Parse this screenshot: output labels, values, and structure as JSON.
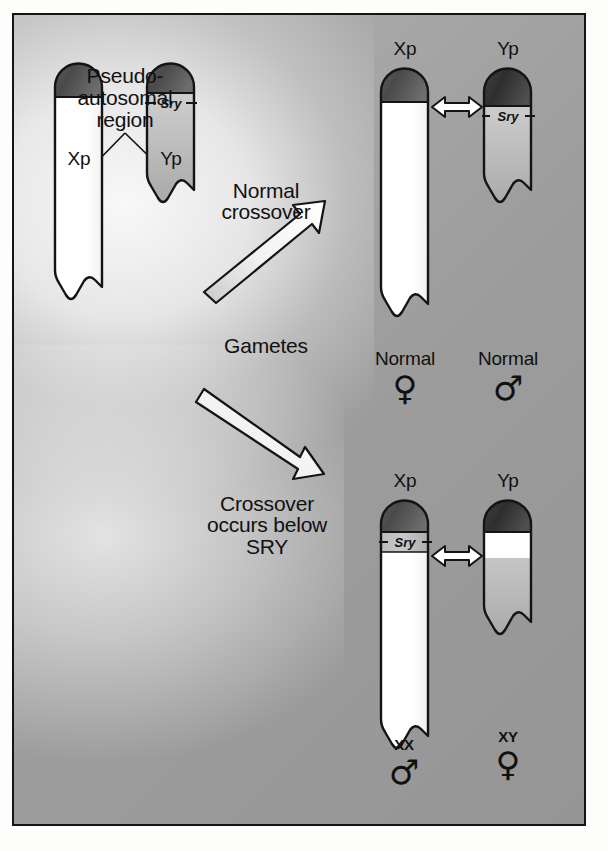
{
  "figure": {
    "background_color": "#a6a6a6",
    "frame_color": "#141414"
  },
  "annotations": {
    "pseudoautosomal": "Pseudo-\nautosomal\nregion",
    "normal_crossover": "Normal\ncrossover",
    "gametes": "Gametes",
    "abnormal_crossover": "Crossover\noccurs below\nSRY"
  },
  "parents": {
    "x_label": "Xp",
    "y_label": "Yp",
    "sry_label": "Sry"
  },
  "normal_outcome": {
    "x_label": "Xp",
    "y_label": "Yp",
    "sry_label": "Sry",
    "female_text": "Normal",
    "female_symbol": "♀",
    "male_text": "Normal",
    "male_symbol": "♂"
  },
  "abnormal_outcome": {
    "x_label": "Xp",
    "y_label": "Yp",
    "sry_label": "Sry",
    "male_karyotype": "XX",
    "male_symbol": "♂",
    "female_karyotype": "XY",
    "female_symbol": "♀"
  },
  "icons": {
    "normal_arrow": "arrow-up-right-icon",
    "abnormal_arrow": "arrow-down-right-icon",
    "pairing_arrow": "double-headed-arrow-icon",
    "female": "venus-symbol-icon",
    "male": "mars-symbol-icon"
  }
}
